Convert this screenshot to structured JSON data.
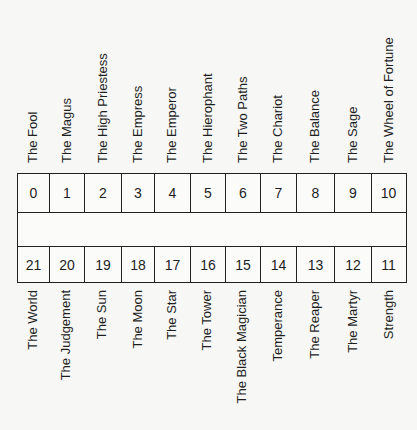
{
  "diagram": {
    "top_row": {
      "cells": [
        "0",
        "1",
        "2",
        "3",
        "4",
        "5",
        "6",
        "7",
        "8",
        "9",
        "10"
      ],
      "labels": [
        "The Fool",
        "The Magus",
        "The High Priestess",
        "The Empress",
        "The Emperor",
        "The Hierophant",
        "The Two Paths",
        "The Chariot",
        "The Balance",
        "The Sage",
        "The Wheel of Fortune"
      ]
    },
    "bottom_row": {
      "cells": [
        "21",
        "20",
        "19",
        "18",
        "17",
        "16",
        "15",
        "14",
        "13",
        "12",
        "11"
      ],
      "labels": [
        "The World",
        "The Judgement",
        "The Sun",
        "The Moon",
        "The Star",
        "The Tower",
        "The Black Magician",
        "Temperance",
        "The Reaper",
        "The Martyr",
        "Strength"
      ]
    },
    "column_widths": [
      32,
      35,
      37,
      33,
      36,
      35,
      35,
      36,
      38,
      37,
      36
    ]
  }
}
